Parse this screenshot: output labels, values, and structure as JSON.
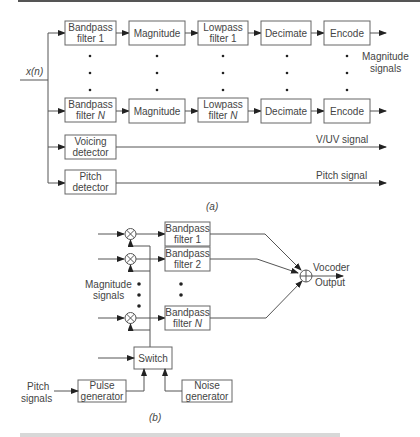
{
  "figure_a": {
    "input_label": "x(n)",
    "channel_1": [
      "Bandpass filter 1",
      "Magnitude",
      "Lowpass filter 1",
      "Decimate",
      "Encode"
    ],
    "channel_N": [
      "Bandpass filter N",
      "Magnitude",
      "Lowpass filter N",
      "Decimate",
      "Encode"
    ],
    "box_labels": {
      "bp1_l1": "Bandpass",
      "bp1_l2": "filter 1",
      "bpN_l1": "Bandpass",
      "bpN_l2": "filter ",
      "bpN_n": "N",
      "mag": "Magnitude",
      "lp1_l1": "Lowpass",
      "lp1_l2": "filter 1",
      "lpN_l1": "Lowpass",
      "lpN_l2": "filter ",
      "lpN_n": "N",
      "dec": "Decimate",
      "enc": "Encode",
      "voicing_l1": "Voicing",
      "voicing_l2": "detector",
      "pitch_l1": "Pitch",
      "pitch_l2": "detector"
    },
    "magnitude_signals_l1": "Magnitude",
    "magnitude_signals_l2": "signals",
    "vuv_signal": "V/UV signal",
    "pitch_signal": "Pitch signal",
    "caption": "(a)"
  },
  "figure_b": {
    "bp1_l1": "Bandpass",
    "bp1_l2": "filter 1",
    "bp2_l1": "Bandpass",
    "bp2_l2": "filter 2",
    "bpN_l1": "Bandpass",
    "bpN_l2": "filter ",
    "bpN_n": "N",
    "magnitude_signals_l1": "Magnitude",
    "magnitude_signals_l2": "signals",
    "vocoder_l1": "Vocoder",
    "vocoder_l2": "Output",
    "switch": "Switch",
    "pulse_l1": "Pulse",
    "pulse_l2": "generator",
    "noise_l1": "Noise",
    "noise_l2": "generator",
    "pitch_signals_l1": "Pitch",
    "pitch_signals_l2": "signals",
    "caption": "(b)"
  }
}
